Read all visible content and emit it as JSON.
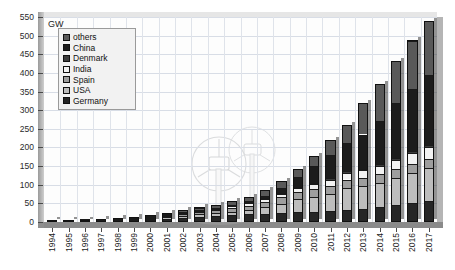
{
  "chart": {
    "unit_label": "GW",
    "axis": {
      "y_ticks": [
        0,
        50,
        100,
        150,
        200,
        250,
        300,
        350,
        400,
        450,
        500,
        550
      ],
      "ylim": [
        0,
        550
      ]
    },
    "legend": {
      "entries": [
        {
          "label": "others",
          "color": "#595959"
        },
        {
          "label": "China",
          "color": "#1c1c1c"
        },
        {
          "label": "Denmark",
          "color": "#3c3c3c"
        },
        {
          "label": "India",
          "color": "#f2f2f2"
        },
        {
          "label": "Spain",
          "color": "#9e9e9e"
        },
        {
          "label": "USA",
          "color": "#bdbdbd"
        },
        {
          "label": "Germany",
          "color": "#262626"
        }
      ]
    },
    "watermark": "wind-turbines-illustration"
  },
  "chart_data": {
    "type": "bar",
    "stacked": true,
    "title": "",
    "subtitle": "",
    "xlabel": "",
    "ylabel": "GW",
    "ylim": [
      0,
      550
    ],
    "ytick_step": 50,
    "grid": true,
    "legend_position": "top-left",
    "categories": [
      "1994",
      "1995",
      "1996",
      "1997",
      "1998",
      "1999",
      "2000",
      "2001",
      "2002",
      "2003",
      "2004",
      "2005",
      "2006",
      "2007",
      "2008",
      "2009",
      "2010",
      "2011",
      "2012",
      "2013",
      "2014",
      "2015",
      "2016",
      "2017"
    ],
    "stack_order_bottom_to_top": [
      "Germany",
      "USA",
      "Spain",
      "India",
      "Denmark",
      "China",
      "others"
    ],
    "series": [
      {
        "name": "Germany",
        "color": "#262626",
        "values": [
          0.6,
          1.1,
          1.6,
          2.1,
          2.9,
          4.4,
          6.1,
          8.8,
          12.0,
          14.6,
          16.6,
          18.4,
          20.6,
          22.2,
          23.9,
          25.8,
          27.2,
          29.1,
          31.3,
          34.3,
          39.2,
          44.9,
          50.0,
          56.1
        ]
      },
      {
        "name": "USA",
        "color": "#bdbdbd",
        "values": [
          1.6,
          1.6,
          1.6,
          1.6,
          1.8,
          2.5,
          2.6,
          4.3,
          4.7,
          6.4,
          6.8,
          9.1,
          11.6,
          16.8,
          25.2,
          35.2,
          40.3,
          47.0,
          60.0,
          61.1,
          65.9,
          74.5,
          82.2,
          89.1
        ]
      },
      {
        "name": "Spain",
        "color": "#9e9e9e",
        "values": [
          0.1,
          0.1,
          0.2,
          0.5,
          0.9,
          1.8,
          2.5,
          3.3,
          4.8,
          6.2,
          8.3,
          10.0,
          11.6,
          15.1,
          16.7,
          19.1,
          20.6,
          21.6,
          22.8,
          23.0,
          23.0,
          23.0,
          23.1,
          23.2
        ]
      },
      {
        "name": "India",
        "color": "#f2f2f2",
        "values": [
          0.1,
          0.2,
          0.8,
          0.9,
          1.0,
          1.1,
          1.2,
          1.5,
          1.7,
          2.1,
          3.0,
          4.4,
          6.3,
          7.8,
          9.6,
          10.9,
          13.1,
          16.1,
          18.4,
          20.2,
          22.5,
          25.1,
          28.7,
          32.8
        ]
      },
      {
        "name": "Denmark",
        "color": "#3c3c3c",
        "values": [
          0.5,
          0.6,
          0.8,
          1.1,
          1.4,
          1.7,
          2.3,
          2.5,
          2.9,
          3.1,
          3.1,
          3.1,
          3.1,
          3.1,
          3.2,
          3.5,
          3.8,
          3.9,
          4.2,
          4.8,
          4.9,
          5.1,
          5.2,
          5.5
        ]
      },
      {
        "name": "China",
        "color": "#1c1c1c",
        "values": [
          0.0,
          0.0,
          0.1,
          0.1,
          0.2,
          0.3,
          0.3,
          0.4,
          0.5,
          0.6,
          0.8,
          1.3,
          2.6,
          5.9,
          12.2,
          25.8,
          44.7,
          62.4,
          75.3,
          91.4,
          114.6,
          145.4,
          168.7,
          188.4
        ]
      },
      {
        "name": "others",
        "color": "#595959",
        "values": [
          0.5,
          0.7,
          0.9,
          1.2,
          1.5,
          2.0,
          2.5,
          3.2,
          4.4,
          5.9,
          7.4,
          9.7,
          11.2,
          15.1,
          19.2,
          22.7,
          28.3,
          38.9,
          47.0,
          84.2,
          99.9,
          115.0,
          129.1,
          144.9
        ]
      }
    ],
    "totals": [
      3.4,
      4.3,
      6.0,
      7.5,
      9.7,
      13.8,
      17.5,
      24.0,
      31.0,
      39.0,
      46.0,
      56.0,
      67.0,
      86.0,
      110.0,
      143.0,
      178.0,
      219.0,
      259.0,
      319.0,
      370.0,
      433.0,
      487.0,
      540.0
    ]
  }
}
